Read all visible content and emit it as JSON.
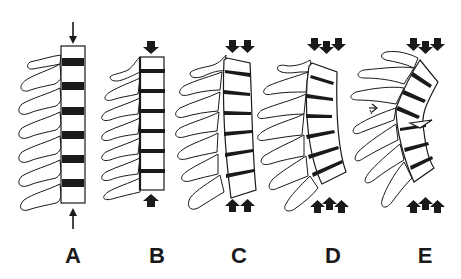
{
  "figure": {
    "panels": [
      {
        "id": "A",
        "label": "A",
        "load": "thin-arrows",
        "arrows_top": 1,
        "arrows_bottom": 1,
        "curvature": "straight"
      },
      {
        "id": "B",
        "label": "B",
        "load": "block-arrows",
        "arrows_top": 1,
        "arrows_bottom": 1,
        "curvature": "straight"
      },
      {
        "id": "C",
        "label": "C",
        "load": "block-arrows",
        "arrows_top": 2,
        "arrows_bottom": 2,
        "curvature": "slight-kyphosis"
      },
      {
        "id": "D",
        "label": "D",
        "load": "block-arrows",
        "arrows_top": 3,
        "arrows_bottom": 3,
        "curvature": "kyphosis"
      },
      {
        "id": "E",
        "label": "E",
        "load": "block-arrows",
        "arrows_top": 3,
        "arrows_bottom": 3,
        "curvature": "kyphosis-with-fracture",
        "annotation": "open-arrow-pointing-right"
      }
    ],
    "colors": {
      "ink": "#1a1a1a",
      "background": "#ffffff"
    }
  }
}
